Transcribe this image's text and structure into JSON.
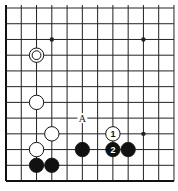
{
  "diagram": {
    "type": "go-board-fragment",
    "columns": 12,
    "rows": 12,
    "origin_x": 6,
    "origin_y": 8,
    "spacing_x": 15.27,
    "spacing_y": 15.73,
    "edges": {
      "left": true,
      "bottom": true,
      "top": false,
      "right": false
    },
    "colors": {
      "line": "#222222",
      "edge": "#111111",
      "black_stone": "#111111",
      "white_stone": "#ffffff",
      "stone_outline": "#111111",
      "background": "#ffffff"
    },
    "star_points": [
      {
        "col": 3,
        "row": 2
      },
      {
        "col": 9,
        "row": 2
      },
      {
        "col": 9,
        "row": 8
      }
    ],
    "stones": [
      {
        "col": 2,
        "row": 3,
        "color": "white",
        "marker": "circle"
      },
      {
        "col": 2,
        "row": 6,
        "color": "white"
      },
      {
        "col": 3,
        "row": 8,
        "color": "white"
      },
      {
        "col": 2,
        "row": 9,
        "color": "white"
      },
      {
        "col": 7,
        "row": 8,
        "color": "white",
        "label": "1"
      },
      {
        "col": 2,
        "row": 10,
        "color": "black"
      },
      {
        "col": 3,
        "row": 10,
        "color": "black"
      },
      {
        "col": 5,
        "row": 9,
        "color": "black"
      },
      {
        "col": 7,
        "row": 9,
        "color": "black",
        "label": "2"
      },
      {
        "col": 8,
        "row": 9,
        "color": "black"
      }
    ],
    "labels": [
      {
        "col": 5,
        "row": 7,
        "text": "A"
      }
    ]
  }
}
